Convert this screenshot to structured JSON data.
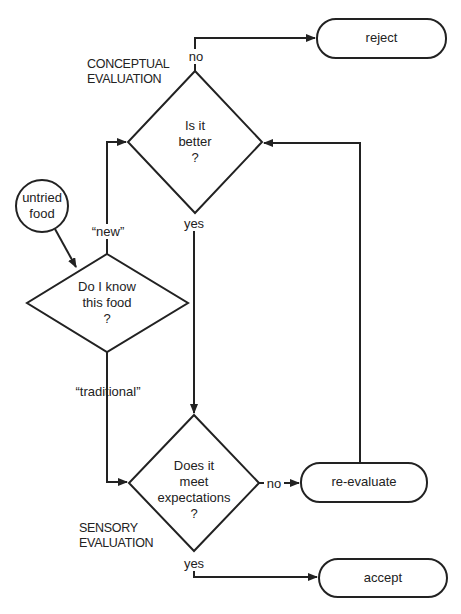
{
  "diagram": {
    "type": "flowchart",
    "title": "",
    "colors": {
      "stroke": "#222222",
      "background": "#ffffff"
    },
    "nodes": {
      "start": {
        "id": "untried-food",
        "shape": "circle",
        "line1": "untried",
        "line2": "food"
      },
      "know": {
        "id": "do-i-know",
        "shape": "diamond",
        "line1": "Do I know",
        "line2": "this food",
        "line3": "?"
      },
      "better": {
        "id": "is-it-better",
        "shape": "diamond",
        "line1": "Is it",
        "line2": "better",
        "line3": "?"
      },
      "meet": {
        "id": "meets-expectations",
        "shape": "diamond",
        "line1": "Does it",
        "line2": "meet",
        "line3": "expectations",
        "line4": "?"
      },
      "reject": {
        "id": "reject",
        "shape": "rounded-rect",
        "label": "reject"
      },
      "reevaluate": {
        "id": "re-evaluate",
        "shape": "rounded-rect",
        "label": "re-evaluate"
      },
      "accept": {
        "id": "accept",
        "shape": "rounded-rect",
        "label": "accept"
      }
    },
    "edge_labels": {
      "new": "“new”",
      "traditional": "“traditional”",
      "better_no": "no",
      "better_yes": "yes",
      "meet_no": "no",
      "meet_yes": "yes"
    },
    "section_labels": {
      "conceptual_line1": "CONCEPTUAL",
      "conceptual_line2": "EVALUATION",
      "sensory_line1": "SENSORY",
      "sensory_line2": "EVALUATION"
    },
    "edges": [
      {
        "from": "untried-food",
        "to": "do-i-know"
      },
      {
        "from": "do-i-know",
        "to": "is-it-better",
        "label": "“new”"
      },
      {
        "from": "do-i-know",
        "to": "meets-expectations",
        "label": "“traditional”"
      },
      {
        "from": "is-it-better",
        "to": "reject",
        "label": "no"
      },
      {
        "from": "is-it-better",
        "to": "meets-expectations",
        "label": "yes"
      },
      {
        "from": "meets-expectations",
        "to": "re-evaluate",
        "label": "no"
      },
      {
        "from": "meets-expectations",
        "to": "accept",
        "label": "yes"
      },
      {
        "from": "re-evaluate",
        "to": "is-it-better"
      }
    ]
  }
}
